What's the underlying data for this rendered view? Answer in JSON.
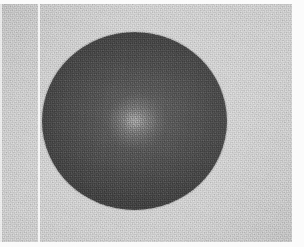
{
  "figure": {
    "kind": "scanned-grayscale-photograph",
    "caption": "",
    "width": 304,
    "height": 247
  },
  "colors": {
    "paper": "#d9d9d9",
    "paper_light": "#e6e6e6",
    "margin": "#fbfbfb",
    "sphere_mid": "#393939",
    "sphere_rim": "#2e2e2e",
    "sphere_center": "#5b5b5b",
    "highlight": "#bebebe",
    "scan_line": "#ffffff"
  },
  "geometry": {
    "sphere": {
      "center_x": 134,
      "center_y": 121,
      "radius_x": 92,
      "radius_y": 89,
      "left": 42,
      "top": 32,
      "right": 227,
      "bottom": 210
    },
    "highlight": {
      "center_x": 137,
      "center_y": 122,
      "radius_x": 29,
      "radius_y": 26
    },
    "scan_line_vertical": {
      "x": 38,
      "width": 2
    },
    "margins": {
      "top": 4,
      "bottom": 5,
      "right": 12,
      "left": 2
    }
  },
  "labels": {
    "sphere": "dark spherical body",
    "highlight": "central bright patch",
    "background": "textured light-gray field",
    "scan_line": "vertical scan artifact line"
  }
}
